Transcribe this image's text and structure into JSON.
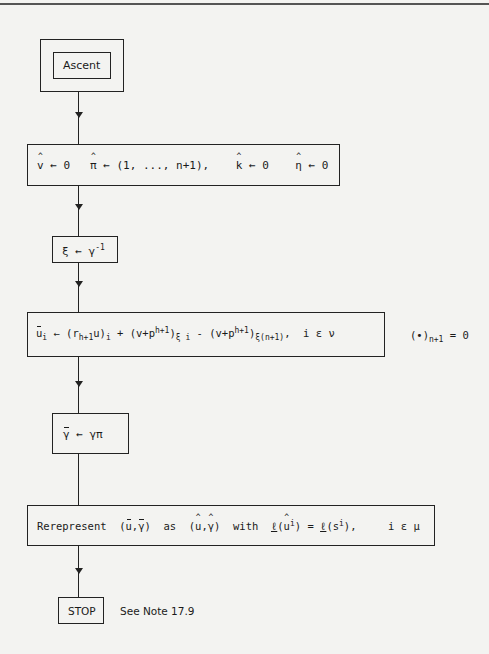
{
  "diagram": {
    "type": "flowchart",
    "nodes": [
      {
        "id": "ascent",
        "label": "Ascent",
        "shape": "double-box"
      },
      {
        "id": "init",
        "parts": {
          "v": "v",
          "v_assign": " ← 0   ",
          "pi": "π",
          "pi_assign": " ← (1, ..., n+1),    ",
          "k": "k",
          "k_assign": " ← 0    ",
          "eta": "η",
          "eta_assign": " ← 0"
        }
      },
      {
        "id": "xi",
        "parts": {
          "lhs": "ξ ← γ",
          "sup": "-1"
        }
      },
      {
        "id": "ubar",
        "parts": {
          "u": "u",
          "sub_i": "i",
          "t1": " ← (r",
          "sub_h1": "h+1",
          "t2": "u)",
          "sub_i2": "i",
          "t3": " + (v+p",
          "sup_h1": "h+1",
          "t4": ")",
          "sub_xi": "ξ i",
          "t5": " - (v+p",
          "sup_h1b": "h+1",
          "t6": ")",
          "sub_xin": "ξ(n+1)",
          "t7": ",  i ε ν"
        }
      },
      {
        "id": "gbar",
        "parts": {
          "g": "γ",
          "rest": " ← γπ"
        }
      },
      {
        "id": "rerep",
        "parts": {
          "t1": "Rerepresent  (",
          "u": "u",
          "comma": ",",
          "g": "γ",
          "t2": ")  as  (",
          "uh": "u",
          "comma2": ",",
          "gh": "γ",
          "t3": ")  with  ",
          "l1": "ℓ",
          "t4": "(",
          "uh2": "u",
          "sup_i": "i",
          "t5": ") = ",
          "l2": "ℓ",
          "t6": "(s",
          "sup_i2": "i",
          "t7": "),     i ε μ"
        }
      },
      {
        "id": "stop",
        "label": "STOP"
      }
    ],
    "side_note_1": {
      "t1": "(•)",
      "sub": "n+1",
      "t2": " = 0"
    },
    "side_note_2": "See Note 17.9",
    "edges": [
      [
        "ascent",
        "init"
      ],
      [
        "init",
        "xi"
      ],
      [
        "xi",
        "ubar"
      ],
      [
        "ubar",
        "gbar"
      ],
      [
        "gbar",
        "rerep"
      ],
      [
        "rerep",
        "stop"
      ]
    ]
  }
}
